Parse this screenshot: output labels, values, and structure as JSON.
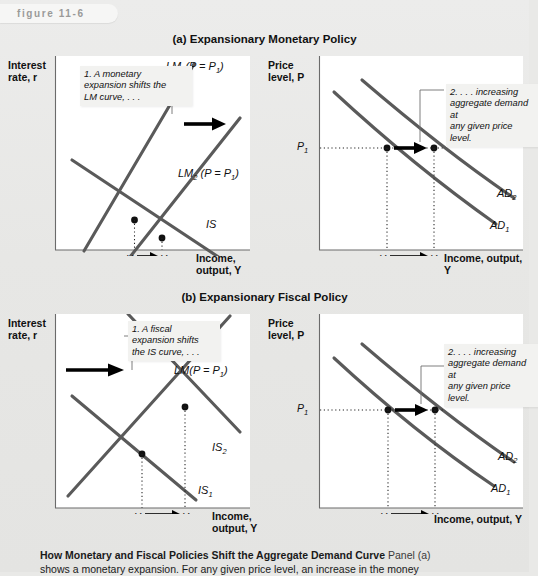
{
  "figure": {
    "badge_label": "figure 11-6"
  },
  "panels": {
    "a": {
      "title": "(a) Expansionary Monetary Policy"
    },
    "b": {
      "title": "(b) Expansionary Fiscal Policy"
    }
  },
  "charts": {
    "a_left": {
      "y_axis_label_line1": "Interest",
      "y_axis_label_line2": "rate, r",
      "x_axis_label_line1": "Income,",
      "x_axis_label_line2": "output, Y",
      "callout": "1. A monetary expansion shifts the LM curve, . . .",
      "callout_lines": [
        "1. A monetary",
        "expansion shifts the",
        "LM curve, . . ."
      ],
      "curves": [
        {
          "name": "LM1",
          "base": "LM",
          "sub": "1",
          "tail": "(P = P",
          "tail_sub": "1",
          "tail_end": ")"
        },
        {
          "name": "LM2",
          "base": "LM",
          "sub": "2",
          "tail": " (P = P",
          "tail_sub": "1",
          "tail_end": ")"
        },
        {
          "name": "IS",
          "base": "IS",
          "sub": "",
          "tail": "",
          "tail_sub": "",
          "tail_end": ""
        }
      ],
      "x_ticks": [
        {
          "base": "Y",
          "sub": "1"
        },
        {
          "base": "Y",
          "sub": "2"
        }
      ]
    },
    "a_right": {
      "y_axis_label_line1": "Price",
      "y_axis_label_line2": "level, P",
      "x_axis_label_line1": "Income, output, Y",
      "x_axis_label_line2": "",
      "callout": "2. . . . increasing aggregate demand at any given price level.",
      "callout_lines": [
        "2. . . . increasing",
        "aggregate demand at",
        "any given price level."
      ],
      "curves": [
        {
          "name": "AD2",
          "base": "AD",
          "sub": "2"
        },
        {
          "name": "AD1",
          "base": "AD",
          "sub": "1"
        }
      ],
      "y_ticks": [
        {
          "base": "P",
          "sub": "1"
        }
      ],
      "x_ticks": [
        {
          "base": "Y",
          "sub": "1"
        },
        {
          "base": "Y",
          "sub": "2"
        }
      ]
    },
    "b_left": {
      "y_axis_label_line1": "Interest",
      "y_axis_label_line2": "rate, r",
      "x_axis_label_line1": "Income,",
      "x_axis_label_line2": "output, Y",
      "callout": "1. A fiscal expansion shifts the IS curve, . . .",
      "callout_lines": [
        "1. A fiscal",
        "expansion shifts",
        "the IS curve, . . ."
      ],
      "curves": [
        {
          "name": "LM",
          "base": "LM",
          "sub": "",
          "tail": "(P = P",
          "tail_sub": "1",
          "tail_end": ")"
        },
        {
          "name": "IS2",
          "base": "IS",
          "sub": "2"
        },
        {
          "name": "IS1",
          "base": "IS",
          "sub": "1"
        }
      ],
      "x_ticks": [
        {
          "base": "Y",
          "sub": "1"
        },
        {
          "base": "Y",
          "sub": "2"
        }
      ]
    },
    "b_right": {
      "y_axis_label_line1": "Price",
      "y_axis_label_line2": "level, P",
      "x_axis_label_line1": "Income, output, Y",
      "x_axis_label_line2": "",
      "callout": "2. . . . increasing aggregate demand at any given price level.",
      "callout_lines": [
        "2. . . . increasing",
        "aggregate demand at",
        "any given price level."
      ],
      "curves": [
        {
          "name": "AD2",
          "base": "AD",
          "sub": "2"
        },
        {
          "name": "AD1",
          "base": "AD",
          "sub": "1"
        }
      ],
      "y_ticks": [
        {
          "base": "P",
          "sub": "1"
        }
      ],
      "x_ticks": [
        {
          "base": "Y",
          "sub": "1"
        },
        {
          "base": "Y",
          "sub": "2"
        }
      ]
    }
  },
  "caption": {
    "title": "How Monetary and Fiscal Policies Shift the Aggregate Demand Curve",
    "body": "Panel (a)",
    "line2": "shows a monetary expansion. For any given price level, an increase in the money"
  },
  "colors": {
    "page_background": "#e9e9e7",
    "plot_background": "#ffffff",
    "curve": "#5a5a5a",
    "axis": "#6b6b6b",
    "arrow": "#000000",
    "badge_text": "#9a9a99",
    "callout_background": "#f2f2f0"
  }
}
